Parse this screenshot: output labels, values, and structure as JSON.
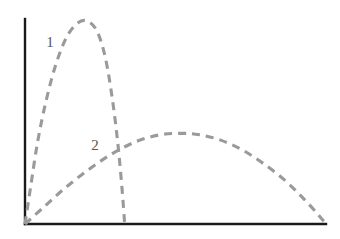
{
  "chart_data": {
    "type": "line",
    "title": "",
    "subtitle": "",
    "xlabel": "",
    "ylabel": "",
    "grid": false,
    "legend_position": "inline-annotations",
    "axis_color": "#1a1a1a",
    "curve_color": "#9a9a9a",
    "line_style": "dashed",
    "axes": {
      "x_axis": {
        "x_start": 25,
        "x_end": 326,
        "y": 224
      },
      "y_axis": {
        "x": 25,
        "y_start": 19,
        "y_end": 224
      },
      "xlim": [
        0,
        100
      ],
      "ylim": [
        0,
        100
      ],
      "ticks_shown": false,
      "tick_labels": []
    },
    "series": [
      {
        "name": "1",
        "label": "1",
        "label_position": {
          "x": 50,
          "y": 47
        },
        "description": "steep narrow peak rising from origin, peaking early then falling back to axis",
        "points": [
          [
            0,
            0
          ],
          [
            4,
            18
          ],
          [
            9,
            40
          ],
          [
            15,
            60
          ],
          [
            22,
            78
          ],
          [
            30,
            92
          ],
          [
            38,
            99
          ],
          [
            45,
            100
          ],
          [
            52,
            95
          ],
          [
            58,
            82
          ],
          [
            63,
            62
          ],
          [
            67,
            40
          ],
          [
            70,
            18
          ],
          [
            72,
            0
          ]
        ]
      },
      {
        "name": "2",
        "label": "2",
        "label_position": {
          "x": 95,
          "y": 150
        },
        "description": "broad low hump rising gradually from origin, wide plateau in the middle, long gentle descent to the right end of the axis",
        "points": [
          [
            0,
            0
          ],
          [
            6,
            12
          ],
          [
            13,
            26
          ],
          [
            21,
            40
          ],
          [
            29,
            52
          ],
          [
            37,
            61
          ],
          [
            45,
            66
          ],
          [
            52,
            67
          ],
          [
            58,
            66
          ],
          [
            65,
            62
          ],
          [
            72,
            55
          ],
          [
            79,
            45
          ],
          [
            86,
            33
          ],
          [
            92,
            20
          ],
          [
            97,
            8
          ],
          [
            100,
            0
          ]
        ]
      }
    ],
    "annotations": [
      {
        "text": "1",
        "x": 50,
        "y": 47
      },
      {
        "text": "2",
        "x": 95,
        "y": 150
      }
    ]
  }
}
